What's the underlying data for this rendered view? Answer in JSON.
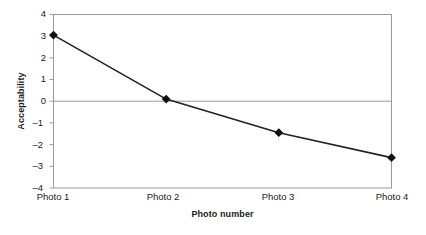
{
  "chart_data": {
    "type": "line",
    "title": "",
    "xlabel": "Photo number",
    "ylabel": "Acceptability",
    "categories": [
      "Photo 1",
      "Photo 2",
      "Photo 3",
      "Photo 4"
    ],
    "values": [
      3.05,
      0.1,
      -1.45,
      -2.6
    ],
    "series": [
      {
        "name": "Acceptability",
        "values": [
          3.05,
          0.1,
          -1.45,
          -2.6
        ]
      }
    ],
    "ylim": [
      -4,
      4
    ],
    "y_ticks": [
      4,
      3,
      2,
      1,
      0,
      -1,
      -2,
      -3,
      -4
    ],
    "y_tick_labels": [
      "4",
      "3",
      "2",
      "1",
      "0",
      "–4",
      "–2",
      "–3",
      "–4"
    ],
    "grid": "zero-line-only",
    "legend": "none",
    "marker": "diamond",
    "colors": {
      "line": "#222222",
      "marker": "#111111",
      "frame": "#9a9a9a",
      "zero_line": "#9a9a9a",
      "text": "#1a1a1a",
      "background": "#ffffff"
    }
  },
  "axes": {
    "y_title": "Acceptability",
    "x_title": "Photo number",
    "y_labels": [
      "4",
      "3",
      "2",
      "1",
      "0",
      "–1",
      "–2",
      "–3",
      "–4"
    ],
    "x_labels": [
      "Photo 1",
      "Photo 2",
      "Photo 3",
      "Photo 4"
    ]
  }
}
